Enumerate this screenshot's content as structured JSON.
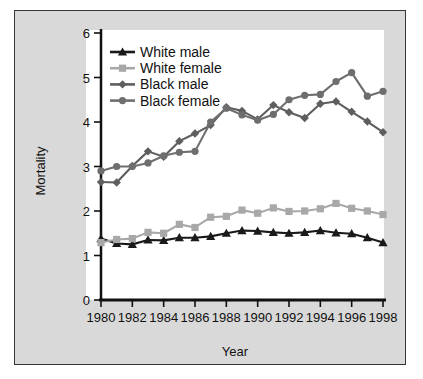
{
  "figure": {
    "background": "#d9d9d9",
    "plot_background": "#ffffff",
    "border_color": "#33363a"
  },
  "chart_data": {
    "type": "line",
    "title": "",
    "xlabel": "Year",
    "ylabel": "Mortality",
    "xlim": [
      1980,
      1998
    ],
    "ylim": [
      0,
      6
    ],
    "xticks": [
      1980,
      1982,
      1984,
      1986,
      1988,
      1990,
      1992,
      1994,
      1996,
      1998
    ],
    "xtick_labels": [
      "1980",
      "1982",
      "1984",
      "1986",
      "1988",
      "1990",
      "1992",
      "1994",
      "1996",
      "1998"
    ],
    "yticks": [
      0,
      1,
      2,
      3,
      4,
      5,
      6
    ],
    "ytick_labels": [
      "0",
      "1",
      "2",
      "3",
      "4",
      "5",
      "6"
    ],
    "grid": false,
    "legend_position": "top-left",
    "x": [
      1980,
      1981,
      1982,
      1983,
      1984,
      1985,
      1986,
      1987,
      1988,
      1989,
      1990,
      1991,
      1992,
      1993,
      1994,
      1995,
      1996,
      1997,
      1998
    ],
    "series": [
      {
        "name": "White male",
        "color": "#1a1a1a",
        "marker": "triangle",
        "values": [
          1.38,
          1.27,
          1.25,
          1.35,
          1.34,
          1.4,
          1.4,
          1.43,
          1.5,
          1.56,
          1.55,
          1.52,
          1.5,
          1.52,
          1.56,
          1.51,
          1.49,
          1.4,
          1.29
        ]
      },
      {
        "name": "White female",
        "color": "#a8a8a8",
        "marker": "square",
        "values": [
          1.29,
          1.36,
          1.38,
          1.52,
          1.5,
          1.7,
          1.63,
          1.86,
          1.88,
          2.02,
          1.95,
          2.07,
          1.99,
          2.0,
          2.05,
          2.17,
          2.06,
          2.0,
          1.92
        ]
      },
      {
        "name": "Black male",
        "color": "#5e5e5e",
        "marker": "diamond",
        "values": [
          2.65,
          2.64,
          3.01,
          3.34,
          3.22,
          3.57,
          3.74,
          3.93,
          4.33,
          4.25,
          4.06,
          4.38,
          4.22,
          4.09,
          4.41,
          4.46,
          4.23,
          4.01,
          3.77
        ]
      },
      {
        "name": "Black female",
        "color": "#6e6e6e",
        "marker": "circle",
        "values": [
          2.9,
          3.0,
          3.0,
          3.08,
          3.24,
          3.32,
          3.34,
          4.0,
          4.31,
          4.16,
          4.04,
          4.17,
          4.5,
          4.6,
          4.62,
          4.91,
          5.11,
          4.58,
          4.69
        ]
      }
    ]
  }
}
